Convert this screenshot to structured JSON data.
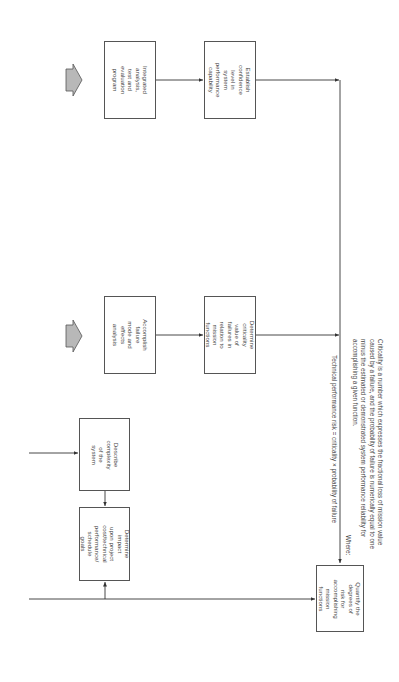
{
  "diagram": {
    "boxes": {
      "integrated": "Integrated\nanalysis,\ntest and\nevaluation\nprogram",
      "establish": "Establish\nconfidence\nlevel in system\nperformance\ncapability",
      "accomplish": "Accomplish\nfailure\nmode and\neffects\nanalysis",
      "criticality": "Determine\ncriticality\nvalue of\nfailures in\nrelation to mission\nfunctions",
      "describe": "Describe\ncomplexity\nof the\nsystem",
      "impact": "Determine impact\nupon project\ncost/technical\nperformance/\nschedule goals",
      "quantify": "Quantify the\ndegrees of\nrisk for\naccomplishing\nmission functions"
    },
    "formula": "Technical performance risk = criticality × probability of failure",
    "where_label": "Where:",
    "where_text": "Criticality is a number which expresses the fractional loss of mission value\ncaused by a failure, and the probability of failure is numerically equal to one\nminus the estimated or demonstrated system performance reliability for\naccomplishing a given function.",
    "colors": {
      "line": "#333333",
      "box_border": "#555555",
      "input_arrow_fill": "#b8b8b8",
      "input_arrow_stroke": "#555555"
    },
    "input_arrows": [
      {
        "name": "input-arrow-1",
        "direction": "right"
      },
      {
        "name": "input-arrow-2",
        "direction": "right"
      }
    ]
  }
}
